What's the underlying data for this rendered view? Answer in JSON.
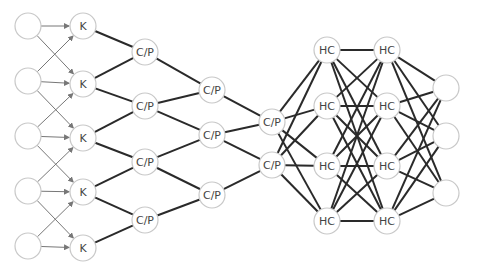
{
  "diagram": {
    "type": "neural-network-architecture",
    "colors": {
      "node_stroke": "#c8c8c8",
      "label": "#444444",
      "arrow_edge": "#777777",
      "thick_edge": "#2a2a2a",
      "background": "#ffffff"
    },
    "node_radius": 13,
    "layers": [
      {
        "id": "input",
        "label": "",
        "x": 28,
        "nodes": [
          {
            "id": "i0",
            "y": 26,
            "label": ""
          },
          {
            "id": "i1",
            "y": 81,
            "label": ""
          },
          {
            "id": "i2",
            "y": 136,
            "label": ""
          },
          {
            "id": "i3",
            "y": 191,
            "label": ""
          },
          {
            "id": "i4",
            "y": 246,
            "label": ""
          }
        ]
      },
      {
        "id": "kernel",
        "x": 83,
        "nodes": [
          {
            "id": "k0",
            "y": 26,
            "label": "K"
          },
          {
            "id": "k1",
            "y": 84,
            "label": "K"
          },
          {
            "id": "k2",
            "y": 138,
            "label": "K"
          },
          {
            "id": "k3",
            "y": 192,
            "label": "K"
          },
          {
            "id": "k4",
            "y": 248,
            "label": "K"
          }
        ]
      },
      {
        "id": "cp1",
        "x": 145,
        "nodes": [
          {
            "id": "a0",
            "y": 52,
            "label": "C/P"
          },
          {
            "id": "a1",
            "y": 106,
            "label": "C/P"
          },
          {
            "id": "a2",
            "y": 162,
            "label": "C/P"
          },
          {
            "id": "a3",
            "y": 220,
            "label": "C/P"
          }
        ]
      },
      {
        "id": "cp2",
        "x": 212,
        "nodes": [
          {
            "id": "b0",
            "y": 90,
            "label": "C/P"
          },
          {
            "id": "b1",
            "y": 135,
            "label": "C/P"
          },
          {
            "id": "b2",
            "y": 195,
            "label": "C/P"
          }
        ]
      },
      {
        "id": "cp3",
        "x": 272,
        "nodes": [
          {
            "id": "c0",
            "y": 122,
            "label": "C/P"
          },
          {
            "id": "c1",
            "y": 165,
            "label": "C/P"
          }
        ]
      },
      {
        "id": "hc1",
        "x": 327,
        "nodes": [
          {
            "id": "h0",
            "y": 50,
            "label": "HC"
          },
          {
            "id": "h1",
            "y": 106,
            "label": "HC"
          },
          {
            "id": "h2",
            "y": 166,
            "label": "HC"
          },
          {
            "id": "h3",
            "y": 221,
            "label": "HC"
          }
        ]
      },
      {
        "id": "hc2",
        "x": 387,
        "nodes": [
          {
            "id": "g0",
            "y": 50,
            "label": "HC"
          },
          {
            "id": "g1",
            "y": 106,
            "label": "HC"
          },
          {
            "id": "g2",
            "y": 166,
            "label": "HC"
          },
          {
            "id": "g3",
            "y": 221,
            "label": "HC"
          }
        ]
      },
      {
        "id": "output",
        "x": 446,
        "nodes": [
          {
            "id": "o0",
            "y": 88,
            "label": ""
          },
          {
            "id": "o1",
            "y": 136,
            "label": ""
          },
          {
            "id": "o2",
            "y": 193,
            "label": ""
          }
        ]
      }
    ],
    "arrow_edges": [
      [
        "i0",
        "k0"
      ],
      [
        "i0",
        "k1"
      ],
      [
        "i1",
        "k0"
      ],
      [
        "i1",
        "k1"
      ],
      [
        "i1",
        "k2"
      ],
      [
        "i2",
        "k1"
      ],
      [
        "i2",
        "k2"
      ],
      [
        "i2",
        "k3"
      ],
      [
        "i3",
        "k2"
      ],
      [
        "i3",
        "k3"
      ],
      [
        "i3",
        "k4"
      ],
      [
        "i4",
        "k3"
      ],
      [
        "i4",
        "k4"
      ]
    ],
    "thick_edges": [
      [
        "k0",
        "a0"
      ],
      [
        "k1",
        "a0"
      ],
      [
        "k1",
        "a1"
      ],
      [
        "k2",
        "a1"
      ],
      [
        "k2",
        "a2"
      ],
      [
        "k3",
        "a2"
      ],
      [
        "k3",
        "a3"
      ],
      [
        "k4",
        "a3"
      ],
      [
        "a0",
        "b0"
      ],
      [
        "a1",
        "b0"
      ],
      [
        "a1",
        "b1"
      ],
      [
        "a2",
        "b1"
      ],
      [
        "a2",
        "b2"
      ],
      [
        "a3",
        "b2"
      ],
      [
        "b0",
        "c0"
      ],
      [
        "b1",
        "c0"
      ],
      [
        "b1",
        "c1"
      ],
      [
        "b2",
        "c1"
      ],
      [
        "c0",
        "h0"
      ],
      [
        "c0",
        "h1"
      ],
      [
        "c0",
        "h2"
      ],
      [
        "c0",
        "h3"
      ],
      [
        "c1",
        "h0"
      ],
      [
        "c1",
        "h1"
      ],
      [
        "c1",
        "h2"
      ],
      [
        "c1",
        "h3"
      ],
      [
        "h0",
        "g0"
      ],
      [
        "h0",
        "g1"
      ],
      [
        "h0",
        "g2"
      ],
      [
        "h0",
        "g3"
      ],
      [
        "h1",
        "g0"
      ],
      [
        "h1",
        "g1"
      ],
      [
        "h1",
        "g2"
      ],
      [
        "h1",
        "g3"
      ],
      [
        "h2",
        "g0"
      ],
      [
        "h2",
        "g1"
      ],
      [
        "h2",
        "g2"
      ],
      [
        "h2",
        "g3"
      ],
      [
        "h3",
        "g0"
      ],
      [
        "h3",
        "g1"
      ],
      [
        "h3",
        "g2"
      ],
      [
        "h3",
        "g3"
      ],
      [
        "g0",
        "o0"
      ],
      [
        "g0",
        "o1"
      ],
      [
        "g0",
        "o2"
      ],
      [
        "g1",
        "o0"
      ],
      [
        "g1",
        "o1"
      ],
      [
        "g1",
        "o2"
      ],
      [
        "g2",
        "o0"
      ],
      [
        "g2",
        "o1"
      ],
      [
        "g2",
        "o2"
      ],
      [
        "g3",
        "o0"
      ],
      [
        "g3",
        "o1"
      ],
      [
        "g3",
        "o2"
      ]
    ]
  }
}
